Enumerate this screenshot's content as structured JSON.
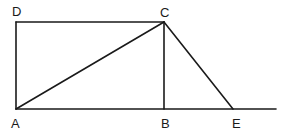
{
  "diagram": {
    "points": {
      "A": {
        "label": "A",
        "x": 16,
        "y": 109
      },
      "B": {
        "label": "B",
        "x": 164,
        "y": 109
      },
      "C": {
        "label": "C",
        "x": 164,
        "y": 22
      },
      "D": {
        "label": "D",
        "x": 16,
        "y": 22
      },
      "E": {
        "label": "E",
        "x": 233,
        "y": 109
      }
    },
    "segments": [
      "DC",
      "DA",
      "AC",
      "CB",
      "CE",
      "AE-extended"
    ],
    "line_color": "#1a1a1a"
  }
}
